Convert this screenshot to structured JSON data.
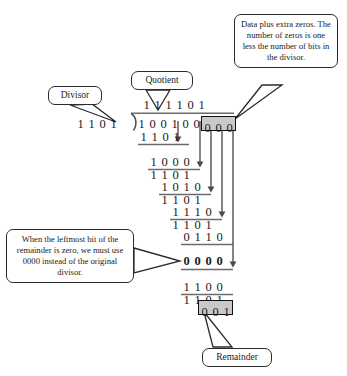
{
  "diagram": {
    "background_color": "#ffffff",
    "ink_color": "#1a1a1a",
    "highlight_fill": "#c9c9c9"
  },
  "callouts": {
    "divisor": {
      "label": "Divisor"
    },
    "quotient": {
      "label": "Quotient"
    },
    "data": {
      "label": "Data plus extra zeros.  The number of zeros is one less the number of bits in the divisor."
    },
    "zero_rule": {
      "label": "When the leftmost bit of the remainder is zero, we must use 0000 instead of the original divisor."
    },
    "remainder": {
      "label": "Remainder"
    }
  },
  "division": {
    "divisor": "1 1 0 1",
    "quotient": "1 1 1 1 0 1",
    "dividend_data": "1 0 0 1 0 0",
    "appended_zeros": "0 0 0",
    "remainder": "0 0 1",
    "steps": [
      {
        "name": "subtrahend-1",
        "bits": "1 1 0 1",
        "bold": false
      },
      {
        "name": "partial-1",
        "bits": "1 0 0 0",
        "bold": false
      },
      {
        "name": "subtrahend-2",
        "bits": "1 1 0 1",
        "bold": false
      },
      {
        "name": "partial-2",
        "bits": "1 0 1 0",
        "bold": false
      },
      {
        "name": "subtrahend-3",
        "bits": "1 1 0 1",
        "bold": false
      },
      {
        "name": "partial-3",
        "bits": "1 1 1 0",
        "bold": false
      },
      {
        "name": "subtrahend-4",
        "bits": "1 1 0 1",
        "bold": false
      },
      {
        "name": "partial-4",
        "bits": "0 1 1 0",
        "bold": false
      },
      {
        "name": "subtrahend-5",
        "bits": "0 0 0 0",
        "bold": true
      },
      {
        "name": "partial-5",
        "bits": "1 1 0 0",
        "bold": false
      },
      {
        "name": "subtrahend-6",
        "bits": "1 1 0 1",
        "bold": false
      }
    ]
  }
}
